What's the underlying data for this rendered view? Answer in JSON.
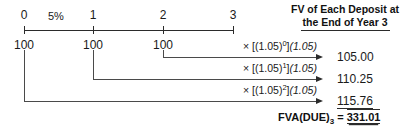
{
  "figure": {
    "interest_rate_label": "5%",
    "periods": [
      {
        "label": "0",
        "x": 24
      },
      {
        "label": "1",
        "x": 93
      },
      {
        "label": "2",
        "x": 163
      },
      {
        "label": "3",
        "x": 233
      }
    ],
    "cash_flows": [
      {
        "label": "100",
        "x": 24
      },
      {
        "label": "100",
        "x": 93
      },
      {
        "label": "100",
        "x": 163
      }
    ],
    "column_header": {
      "line1": "FV of Each Deposit at",
      "line2": "the End of Year 3"
    },
    "rows": [
      {
        "factor_prefix": "× [(1.05)",
        "factor_exponent": "0",
        "factor_suffix": "]",
        "factor_italic": "(1.05)",
        "value": "105.00",
        "start_x": 163,
        "start_y": 50,
        "line_y": 57,
        "factor_x": 243,
        "factor_y": 41,
        "underlined": false
      },
      {
        "factor_prefix": "× [(1.05)",
        "factor_exponent": "1",
        "factor_suffix": "]",
        "factor_italic": "(1.05)",
        "value": "110.25",
        "start_x": 93,
        "start_y": 50,
        "line_y": 79,
        "factor_x": 243,
        "factor_y": 63,
        "underlined": false
      },
      {
        "factor_prefix": "× [(1.05)",
        "factor_exponent": "2",
        "factor_suffix": "]",
        "factor_italic": "(1.05)",
        "value": "115.76",
        "start_x": 24,
        "start_y": 50,
        "line_y": 101,
        "factor_x": 243,
        "factor_y": 85,
        "underlined": true
      }
    ],
    "total": {
      "label_prefix": "FVA(DUE)",
      "label_subscript": "3",
      "equals": " = ",
      "amount": "331.01"
    },
    "colors": {
      "axis": "#2b2b2b",
      "connector": "#4a4a4a",
      "text": "#1a1a1a",
      "background": "#ffffff"
    }
  }
}
